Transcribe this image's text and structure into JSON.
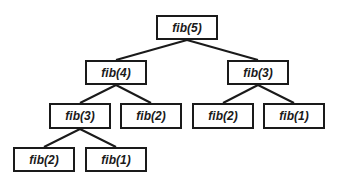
{
  "diagram": {
    "line_color": "#1a1a1a",
    "nodes": [
      {
        "id": "n0",
        "label": "fib(5)",
        "x": 156,
        "y": 15,
        "w": 62,
        "h": 25
      },
      {
        "id": "n1",
        "label": "fib(4)",
        "x": 85,
        "y": 60,
        "w": 62,
        "h": 25
      },
      {
        "id": "n2",
        "label": "fib(3)",
        "x": 227,
        "y": 60,
        "w": 62,
        "h": 25
      },
      {
        "id": "n3",
        "label": "fib(3)",
        "x": 49,
        "y": 103,
        "w": 62,
        "h": 26
      },
      {
        "id": "n4",
        "label": "fib(2)",
        "x": 120,
        "y": 103,
        "w": 62,
        "h": 26
      },
      {
        "id": "n5",
        "label": "fib(2)",
        "x": 192,
        "y": 103,
        "w": 62,
        "h": 26
      },
      {
        "id": "n6",
        "label": "fib(1)",
        "x": 263,
        "y": 103,
        "w": 62,
        "h": 26
      },
      {
        "id": "n7",
        "label": "fib(2)",
        "x": 13,
        "y": 147,
        "w": 62,
        "h": 25
      },
      {
        "id": "n8",
        "label": "fib(1)",
        "x": 85,
        "y": 147,
        "w": 62,
        "h": 25
      }
    ],
    "edges": [
      {
        "from": "n0",
        "to": "n1"
      },
      {
        "from": "n0",
        "to": "n2"
      },
      {
        "from": "n1",
        "to": "n3"
      },
      {
        "from": "n1",
        "to": "n4"
      },
      {
        "from": "n2",
        "to": "n5"
      },
      {
        "from": "n2",
        "to": "n6"
      },
      {
        "from": "n3",
        "to": "n7"
      },
      {
        "from": "n3",
        "to": "n8"
      }
    ]
  }
}
